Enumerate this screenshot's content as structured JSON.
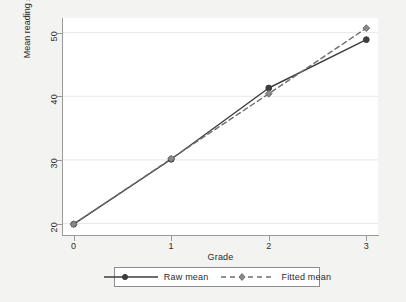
{
  "chart_data": {
    "type": "line",
    "title": "",
    "xlabel": "Grade",
    "ylabel": "Mean reading score",
    "x": [
      0,
      1,
      2,
      3
    ],
    "xticks": [
      "0",
      "1",
      "2",
      "3"
    ],
    "yticks": [
      "20",
      "30",
      "40",
      "50"
    ],
    "xlim": [
      -0.12,
      3.12
    ],
    "ylim": [
      18.2,
      52.3
    ],
    "grid": "horizontal",
    "legend_position": "bottom",
    "series": [
      {
        "name": "Raw mean",
        "style": "solid",
        "marker": "circle",
        "color": "#3d3d3d",
        "values": [
          19.9,
          30.1,
          41.3,
          48.9
        ]
      },
      {
        "name": "Fitted mean",
        "style": "dashed",
        "marker": "diamond",
        "color": "#6e6e6e",
        "values": [
          19.9,
          30.2,
          40.4,
          50.7
        ]
      }
    ]
  },
  "axes": {
    "y_title": "Mean reading score",
    "x_title": "Grade",
    "y_tick_labels": [
      "50",
      "40",
      "30",
      "20"
    ],
    "x_tick_labels": [
      "0",
      "1",
      "2",
      "3"
    ]
  },
  "legend": {
    "entries": [
      {
        "label": "Raw mean",
        "marker": "circle-marker",
        "line": "solid-line"
      },
      {
        "label": "Fitted mean",
        "marker": "diamond-marker",
        "line": "dashed-line"
      }
    ]
  },
  "colors": {
    "page_background": "#f3f3f1",
    "plot_background": "#ffffff",
    "axis": "#9a9a9a",
    "gridline": "#e8e8e8",
    "raw_series": "#3d3d3d",
    "fitted_series": "#6e6e6e",
    "text": "#2b2b2b"
  }
}
